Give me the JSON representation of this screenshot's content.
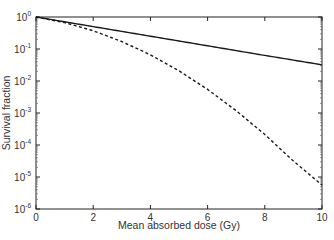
{
  "chart_data": {
    "type": "line",
    "title": "",
    "xlabel": "Mean absorbed dose (Gy)",
    "ylabel": "Survival fraction",
    "xlim": [
      0,
      10
    ],
    "ylim": [
      1e-06,
      1
    ],
    "yscale": "log",
    "grid": false,
    "legend": null,
    "x_ticks": [
      "0",
      "2",
      "4",
      "6",
      "8",
      "10"
    ],
    "y_ticks": [
      {
        "base": "10",
        "exp": "0"
      },
      {
        "base": "10",
        "exp": "-1"
      },
      {
        "base": "10",
        "exp": "-2"
      },
      {
        "base": "10",
        "exp": "-3"
      },
      {
        "base": "10",
        "exp": "-4"
      },
      {
        "base": "10",
        "exp": "-5"
      },
      {
        "base": "10",
        "exp": "-6"
      }
    ],
    "x": [
      0,
      1,
      2,
      3,
      4,
      5,
      6,
      7,
      8,
      9,
      10
    ],
    "series": [
      {
        "name": "solid",
        "style": "solid",
        "color": "#1a1a1a",
        "values": [
          1.0,
          0.708,
          0.501,
          0.355,
          0.251,
          0.178,
          0.126,
          0.089,
          0.063,
          0.045,
          0.032
        ]
      },
      {
        "name": "dashed",
        "style": "dashed",
        "color": "#1a1a1a",
        "values": [
          1.0,
          0.666,
          0.372,
          0.171,
          0.0659,
          0.0208,
          0.00545,
          0.00118,
          0.000213,
          3.16e-05,
          5.6e-06
        ]
      }
    ]
  }
}
